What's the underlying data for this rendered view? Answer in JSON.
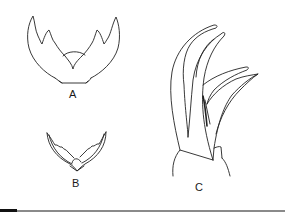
{
  "figure": {
    "panels": [
      {
        "id": "A",
        "label": "A"
      },
      {
        "id": "B",
        "label": "B"
      },
      {
        "id": "C",
        "label": "C"
      }
    ]
  },
  "colors": {
    "stroke": "#222222",
    "background": "#ffffff",
    "rule": "#8a8a8a"
  }
}
